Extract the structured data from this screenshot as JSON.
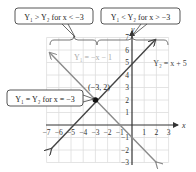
{
  "callouts": {
    "left": "Y₁ > Y₂ for x < −3",
    "right": "Y₁ < Y₂ for x > −3",
    "equal": "Y₁ = Y₂ for x = −3"
  },
  "point_label": "(−3, 2)",
  "line_labels": {
    "y1": "Y₁ = −x − 1",
    "y2": "Y₂ = x + 5"
  },
  "axes": {
    "x_label": "x",
    "y_label": "y",
    "x_ticks": [
      "−7",
      "−6",
      "−5",
      "−4",
      "−3",
      "−2",
      "−1",
      "1",
      "2",
      "3"
    ],
    "y_ticks": [
      "7",
      "6",
      "5",
      "4",
      "3",
      "2",
      "1",
      "−1",
      "−2",
      "−3"
    ]
  },
  "colors": {
    "y1_line": "#8a8a8a",
    "y2_line": "#444444",
    "grid": "#dddddd",
    "axis": "#333333",
    "y1_label": "#aaaaaa"
  }
}
